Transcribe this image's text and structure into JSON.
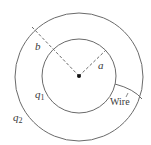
{
  "diagram": {
    "type": "concentric-spherical-conductors",
    "colors": {
      "stroke": "#6a6a6a",
      "text": "#3a3a3a",
      "background": "#ffffff",
      "center_dot": "#111111"
    },
    "outer_sphere": {
      "radius_label": "b",
      "charge_label": "q",
      "charge_subscript": "2"
    },
    "inner_sphere": {
      "radius_label": "a",
      "charge_label": "q",
      "charge_subscript": "1"
    },
    "wire": {
      "label": "Wire"
    }
  }
}
